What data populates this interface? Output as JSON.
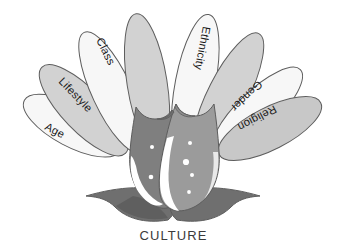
{
  "figure": {
    "title_caption": "CULTURE",
    "diagram_type": "lotus-flower-concept-diagram",
    "colors": {
      "background": "#ffffff",
      "petal_light": "#f7f7f7",
      "petal_grey": "#d2d2d2",
      "petal_grey_dark": "#c8c8c8",
      "outline": "#5d5d5d",
      "bud_dark": "#7f7f7f",
      "bud_mid": "#9b9b9b",
      "bud_highlight": "#ffffff",
      "leaf": "#6f6f6f",
      "leaf_dark": "#5f5f5f",
      "label_text": "#1a1a1a",
      "caption_text": "#3b3b3b"
    },
    "petals": [
      {
        "id": "petal-age",
        "label": "Age",
        "labeled": true,
        "fill_key": "petal_light",
        "angle_deg": -62
      },
      {
        "id": "petal-lifestyle",
        "label": "Lifestyle",
        "labeled": true,
        "fill_key": "petal_grey",
        "angle_deg": -44
      },
      {
        "id": "petal-class",
        "label": "Class",
        "labeled": true,
        "fill_key": "petal_light",
        "angle_deg": -25
      },
      {
        "id": "petal-unnamed-l",
        "label": "",
        "labeled": false,
        "fill_key": "petal_grey",
        "angle_deg": -9
      },
      {
        "id": "petal-ethnicity",
        "label": "Ethnicity",
        "labeled": true,
        "fill_key": "petal_light",
        "angle_deg": 11
      },
      {
        "id": "petal-unnamed-r",
        "label": "",
        "labeled": false,
        "fill_key": "petal_grey",
        "angle_deg": 27
      },
      {
        "id": "petal-gender",
        "label": "Gender",
        "labeled": true,
        "fill_key": "petal_light",
        "angle_deg": 46
      },
      {
        "id": "petal-religion",
        "label": "Religion",
        "labeled": true,
        "fill_key": "petal_grey_dark",
        "angle_deg": 63
      }
    ],
    "bud": {
      "left_lobe_name": "bud-left-lobe",
      "right_lobe_name": "bud-right-lobe",
      "dot_count_left": 2,
      "dot_count_right": 4
    },
    "leaves": {
      "left_name": "leaf-left",
      "right_name": "leaf-right",
      "count": 2
    }
  },
  "labels": {
    "age": "Age",
    "lifestyle": "Lifestyle",
    "class": "Class",
    "ethnicity": "Ethnicity",
    "gender": "Gender",
    "religion": "Religion"
  },
  "caption": {
    "text": "CULTURE"
  }
}
